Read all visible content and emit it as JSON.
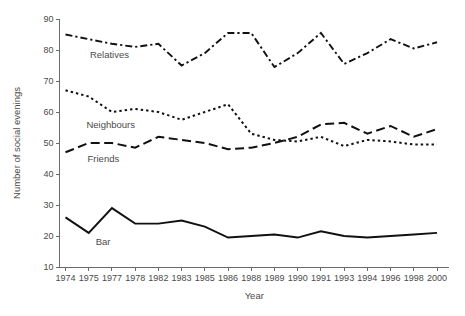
{
  "chart_data": {
    "type": "line",
    "title": "",
    "xlabel": "Year",
    "ylabel": "Number of social evenings",
    "ylim": [
      10,
      90
    ],
    "ytickstep": 10,
    "yticks": [
      10,
      20,
      30,
      40,
      50,
      60,
      70,
      80,
      90
    ],
    "grid": false,
    "legend_position": "inline-labels",
    "categories": [
      "1974",
      "1975",
      "1977",
      "1978",
      "1982",
      "1983",
      "1985",
      "1986",
      "1988",
      "1989",
      "1990",
      "1991",
      "1993",
      "1994",
      "1996",
      "1998",
      "2000"
    ],
    "series": [
      {
        "name": "Relatives",
        "style": "dash-dot",
        "values": [
          85.0,
          83.5,
          82.0,
          81.0,
          82.0,
          75.0,
          79.0,
          85.5,
          85.5,
          74.5,
          79.0,
          85.5,
          75.5,
          79.0,
          83.5,
          80.5,
          82.5
        ]
      },
      {
        "name": "Neighbours",
        "style": "dotted",
        "values": [
          67.0,
          65.0,
          60.0,
          61.0,
          60.0,
          57.5,
          60.0,
          62.5,
          53.0,
          51.0,
          50.5,
          52.0,
          49.0,
          51.0,
          50.5,
          49.5,
          49.5
        ]
      },
      {
        "name": "Friends",
        "style": "long-dash",
        "values": [
          47.0,
          50.0,
          50.0,
          48.5,
          52.0,
          51.0,
          50.0,
          48.0,
          48.5,
          50.0,
          52.0,
          56.0,
          56.5,
          53.0,
          55.5,
          52.0,
          54.5
        ]
      },
      {
        "name": "Bar",
        "style": "solid",
        "values": [
          26.0,
          21.0,
          29.0,
          24.0,
          24.0,
          25.0,
          23.0,
          19.5,
          20.0,
          20.5,
          19.5,
          21.5,
          20.0,
          19.5,
          20.0,
          20.5,
          21.0
        ]
      }
    ],
    "series_label_positions": [
      {
        "name": "Relatives",
        "x": 1.05,
        "y": 77.5
      },
      {
        "name": "Neighbours",
        "x": 0.9,
        "y": 55.0
      },
      {
        "name": "Friends",
        "x": 0.95,
        "y": 44.0
      },
      {
        "name": "Bar",
        "x": 1.3,
        "y": 17.0
      }
    ],
    "colors": {
      "line": "#111111",
      "axis": "#6b6b6b",
      "text": "#4a4a4a",
      "background": "#ffffff"
    }
  }
}
